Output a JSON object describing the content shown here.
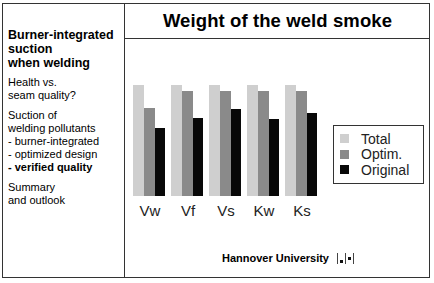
{
  "sidebar": {
    "title": "Burner-integrated\nsuction\nwhen welding",
    "blocks": [
      {
        "lines": [
          {
            "text": "Health vs.",
            "bold": false
          },
          {
            "text": "seam quality?",
            "bold": false
          }
        ]
      },
      {
        "lines": [
          {
            "text": "Suction of",
            "bold": false
          },
          {
            "text": "welding pollutants",
            "bold": false
          },
          {
            "text": "- burner-integrated",
            "bold": false
          },
          {
            "text": "- optimized design",
            "bold": false
          },
          {
            "text": "- verified quality",
            "bold": true
          }
        ]
      },
      {
        "lines": [
          {
            "text": "Summary",
            "bold": false
          },
          {
            "text": "and outlook",
            "bold": false
          }
        ]
      }
    ]
  },
  "header": {
    "title": "Weight of the weld smoke"
  },
  "footer": {
    "institution": "Hannover University",
    "logo_icon": "university-logo-icon"
  },
  "colors": {
    "total": "#cfcfcf",
    "optim": "#8a8a8a",
    "original": "#080808",
    "border": "#333333"
  },
  "chart_data": {
    "type": "bar",
    "title": "Weight of the weld smoke",
    "xlabel": "",
    "ylabel": "",
    "categories": [
      "Vw",
      "Vf",
      "Vs",
      "Kw",
      "Ks"
    ],
    "series": [
      {
        "name": "Total",
        "values": [
          100,
          100,
          100,
          100,
          100
        ]
      },
      {
        "name": "Optim.",
        "values": [
          79,
          95,
          95,
          95,
          95
        ]
      },
      {
        "name": "Original",
        "values": [
          61,
          70,
          78,
          69,
          75
        ]
      }
    ],
    "ylim": [
      0,
      100
    ],
    "grid": false,
    "y_axis_visible": false,
    "legend_position": "right",
    "note": "relative bar heights estimated from pixels; no axis scale shown"
  }
}
